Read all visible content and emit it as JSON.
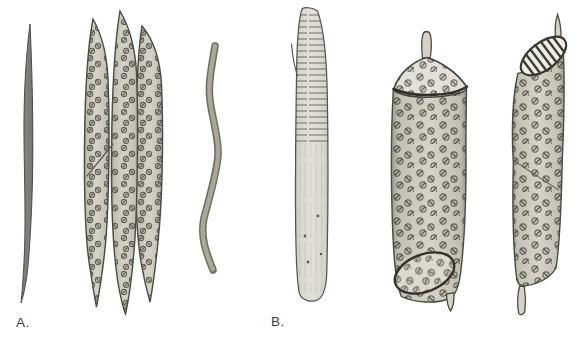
{
  "figure": {
    "panels": [
      {
        "label": "A.",
        "items": [
          "spindle-fiber",
          "tracheid-bundle",
          "wavy-pitted-fiber"
        ]
      },
      {
        "label": "B.",
        "items": [
          "elongate-striated-vessel-element",
          "barrel-vessel-element",
          "scalariform-vessel-element"
        ]
      }
    ]
  },
  "palette": {
    "background": "#ffffff",
    "cell_base": "#d6d3c6",
    "cell_light": "#e2e0d8",
    "outline": "#4c4a42",
    "pit_ring": "#67645a",
    "fiber_fill": "#82807a",
    "label_color": "#3c3c3c"
  }
}
